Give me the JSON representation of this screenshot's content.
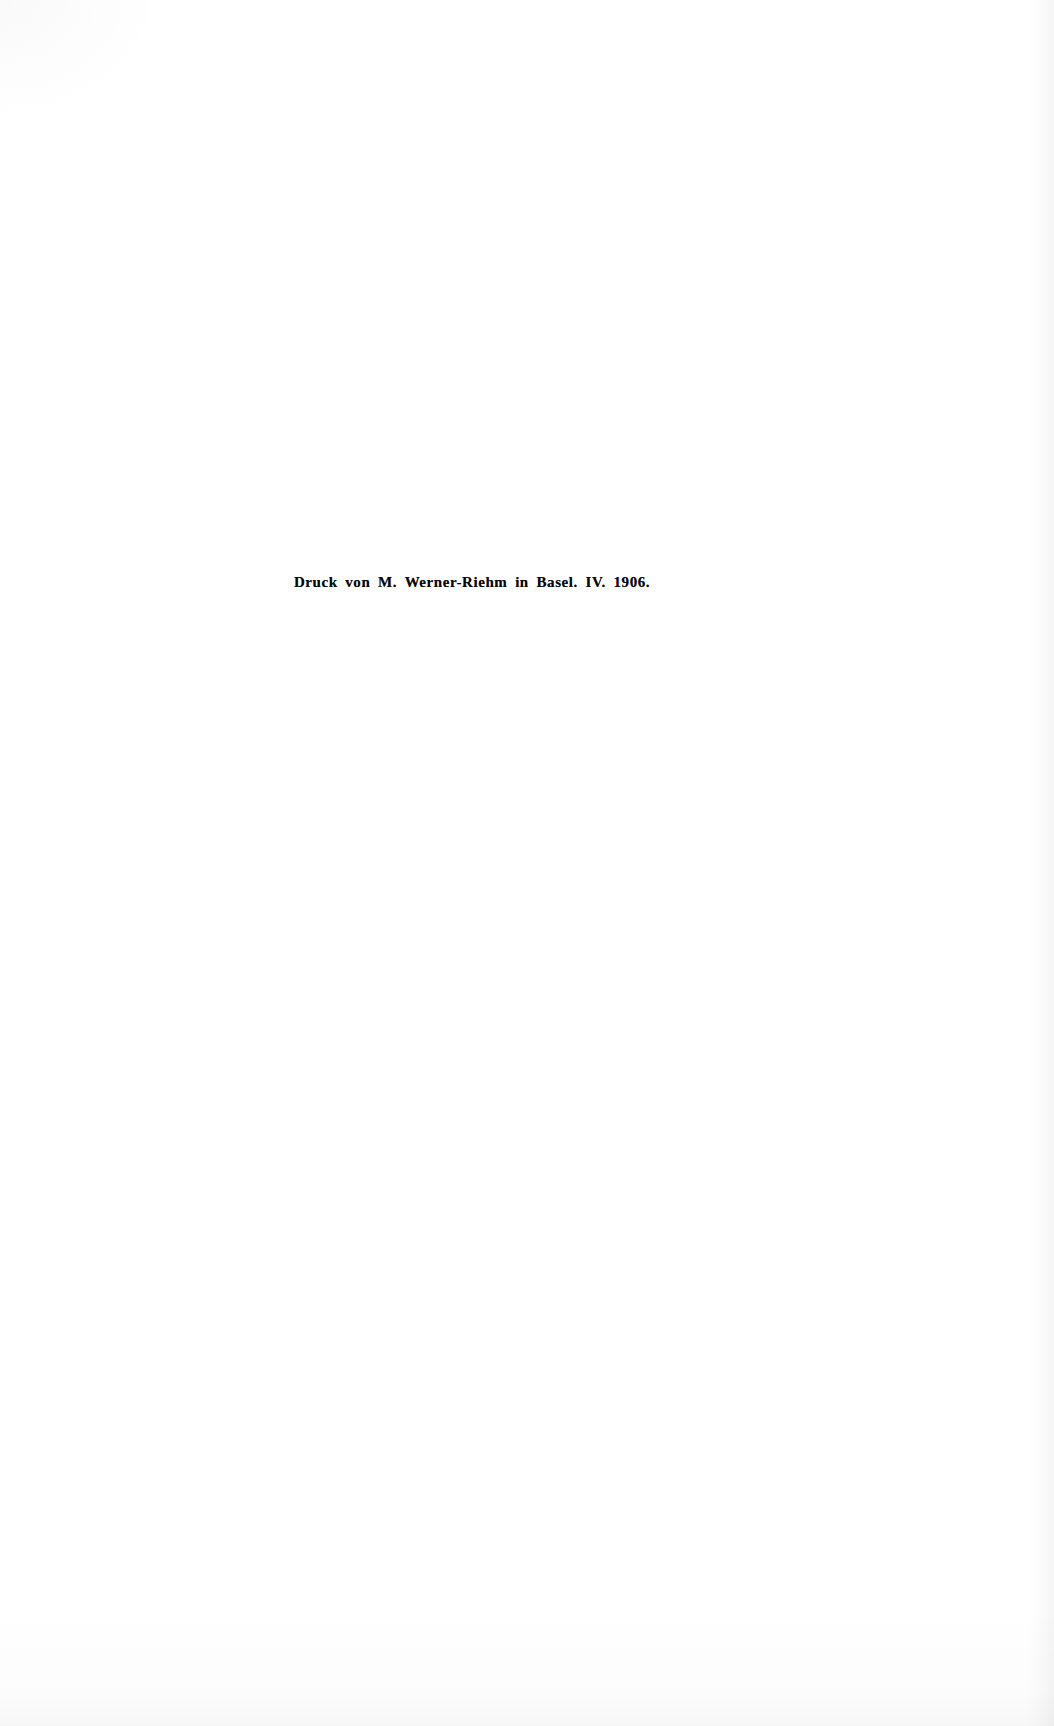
{
  "page": {
    "kind": "scanned-book-colophon-page",
    "background_color": "#ffffff",
    "text_color": "#090909",
    "width": 1054,
    "height": 1726
  },
  "colophon": {
    "full_line": "Druck von M. Werner-Riehm in Basel.  IV. 1906.",
    "printer_statement": "Druck von M. Werner-Riehm",
    "city_statement": "in Basel.",
    "month_roman": "IV.",
    "year": "1906.",
    "space_before_printer": "",
    "space_between_printer_and_city": " ",
    "space_between_city_and_month": "  ",
    "space_between_month_and_year": " "
  }
}
